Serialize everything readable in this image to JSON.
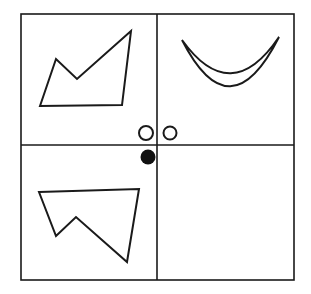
{
  "figure": {
    "title": "",
    "background_color": "#ffffff",
    "stroke_color": "#1a1a1a",
    "fill_color": "#ffffff",
    "filled_dot_color": "#111111",
    "frame": {
      "name": "outer-border",
      "x": 21,
      "y": 14,
      "width": 273,
      "height": 266,
      "stroke_width": 1.6
    },
    "dividers": [
      {
        "name": "vertical-divider",
        "orientation": "vertical",
        "position": 157,
        "from": 14,
        "to": 280,
        "stroke_width": 1.6
      },
      {
        "name": "horizontal-divider",
        "orientation": "horizontal",
        "position": 145,
        "from": 21,
        "to": 294,
        "stroke_width": 1.6
      }
    ],
    "quadrants": [
      {
        "name": "quadrant-top-left",
        "label": "top-left",
        "content": "zigzag-polygon"
      },
      {
        "name": "quadrant-top-right",
        "label": "top-right",
        "content": "crescent"
      },
      {
        "name": "quadrant-bottom-left",
        "label": "bottom-left",
        "content": "zigzag-polygon-flipped"
      },
      {
        "name": "quadrant-bottom-right",
        "label": "bottom-right",
        "content": "empty"
      }
    ],
    "shapes": [
      {
        "name": "zigzag-polygon-top-left",
        "type": "polygon",
        "stroke_width": 2.0,
        "points": [
          [
            40,
            106
          ],
          [
            56,
            59
          ],
          [
            77,
            79
          ],
          [
            131,
            31
          ],
          [
            122,
            105
          ]
        ]
      },
      {
        "name": "crescent-top-right",
        "type": "crescent",
        "stroke_width": 2.0,
        "outer_arc": {
          "start": [
            182,
            40
          ],
          "end": [
            279,
            37
          ],
          "control": [
            230,
            134
          ]
        },
        "inner_arc": {
          "start": [
            279,
            37
          ],
          "end": [
            182,
            40
          ],
          "control": [
            231,
            108
          ]
        }
      },
      {
        "name": "zigzag-polygon-bottom-left",
        "type": "polygon",
        "stroke_width": 2.0,
        "points": [
          [
            39,
            192
          ],
          [
            139,
            189
          ],
          [
            127,
            262
          ],
          [
            76,
            217
          ],
          [
            56,
            236
          ]
        ]
      }
    ],
    "markers": [
      {
        "name": "open-circle-left",
        "type": "circle",
        "filled": false,
        "cx": 146,
        "cy": 133,
        "r": 7,
        "stroke_width": 2.0
      },
      {
        "name": "open-circle-right",
        "type": "circle",
        "filled": false,
        "cx": 170,
        "cy": 133,
        "r": 6.5,
        "stroke_width": 2.0
      },
      {
        "name": "filled-circle",
        "type": "circle",
        "filled": true,
        "cx": 148,
        "cy": 157,
        "r": 7.5,
        "stroke_width": 0
      }
    ]
  }
}
